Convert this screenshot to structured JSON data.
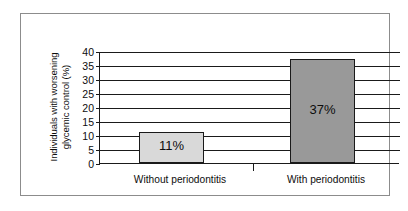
{
  "chart_data": {
    "type": "bar",
    "title": "",
    "subtitle": "",
    "xlabel": "",
    "ylabel": "Individuals with worsening glycemic control (%)",
    "ylabel_lines": [
      "Individuals with worsening",
      "glycemic control (%)"
    ],
    "categories": [
      "Without periodontitis",
      "With periodontitis"
    ],
    "values": [
      11,
      37
    ],
    "data_labels": [
      "11%",
      "37%"
    ],
    "ylim": [
      0,
      40
    ],
    "ytick_step": 5,
    "yticks": [
      40,
      35,
      30,
      25,
      20,
      15,
      10,
      5,
      0
    ],
    "ytick_labels": [
      "40",
      "35",
      "30",
      "25",
      "20",
      "15",
      "10",
      "5",
      "0"
    ],
    "grid": true,
    "grid_axis": "y",
    "legend": false,
    "legend_position": "none",
    "bar_colors": [
      "#d9d9d9",
      "#999999"
    ],
    "bar_edge_color": "#1a1a1a",
    "axis_color": "#1a1a1a",
    "frame_color": "#8c8c8c",
    "background": "#ffffff"
  }
}
